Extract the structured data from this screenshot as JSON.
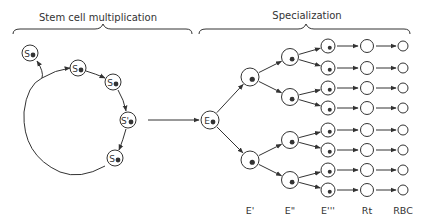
{
  "headers": {
    "left": "Stem cell multiplication",
    "right": "Specialization"
  },
  "stem_cell_label": "S",
  "stem_cells": [
    {
      "x": 30,
      "y": 53,
      "prime": false
    },
    {
      "x": 78,
      "y": 68,
      "prime": false
    },
    {
      "x": 113,
      "y": 82,
      "prime": false
    },
    {
      "x": 128,
      "y": 120,
      "prime": true
    },
    {
      "x": 115,
      "y": 158,
      "prime": false
    }
  ],
  "committed_cell": {
    "label": "E",
    "x": 210,
    "y": 120
  },
  "stage_labels": [
    {
      "text": "E'",
      "x": 250
    },
    {
      "text": "E\"",
      "x": 290
    },
    {
      "text": "E'''",
      "x": 328
    },
    {
      "text": "Rt",
      "x": 367
    },
    {
      "text": "RBC",
      "x": 403
    }
  ],
  "columns": {
    "e1": {
      "x": 250,
      "y": [
        77,
        160
      ]
    },
    "e2": {
      "x": 290,
      "y": [
        57,
        97,
        140,
        180
      ]
    },
    "e3": {
      "x": 328,
      "y": [
        46,
        68,
        88,
        108,
        130,
        150,
        170,
        190
      ]
    },
    "rt": {
      "x": 367
    },
    "rbc": {
      "x": 403
    }
  },
  "colors": {
    "ink": "#333333",
    "background": "#ffffff"
  }
}
